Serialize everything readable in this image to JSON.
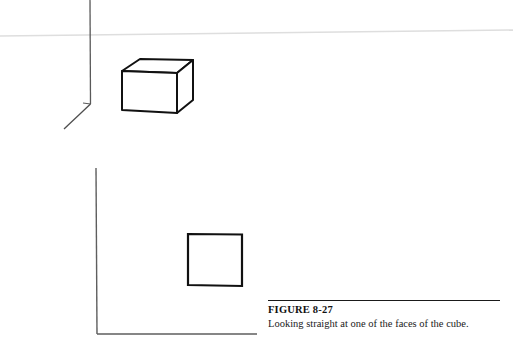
{
  "page": {
    "width": 513,
    "height": 352,
    "background": "#ffffff",
    "ink_color": "#111111",
    "axis_color": "#555555",
    "artifact_color": "#dedede"
  },
  "caption": {
    "label": "FIGURE 8-27",
    "text": "Looking straight at one of the faces of the cube."
  },
  "figures": [
    {
      "id": "perspective-view",
      "name": "three-axis-perspective-cube",
      "axes": {
        "origin": [
          90,
          104
        ],
        "vertical_axis": {
          "from": [
            90,
            0
          ],
          "to": [
            90,
            104
          ]
        },
        "horizontal_axis": {
          "from": [
            83,
            103
          ],
          "to": [
            90,
            104
          ]
        },
        "depth_axis": {
          "from": [
            90,
            104
          ],
          "to": [
            64,
            129
          ]
        }
      },
      "cube": {
        "type": "cube-perspective",
        "front_face": [
          [
            122,
            71
          ],
          [
            177,
            73
          ],
          [
            177,
            113
          ],
          [
            122,
            110
          ]
        ],
        "top_face": [
          [
            122,
            71
          ],
          [
            140,
            59
          ],
          [
            193,
            60
          ],
          [
            177,
            73
          ]
        ],
        "right_face": [
          [
            177,
            73
          ],
          [
            193,
            60
          ],
          [
            193,
            100
          ],
          [
            177,
            113
          ]
        ]
      }
    },
    {
      "id": "front-view",
      "name": "two-axis-square-face",
      "axes": {
        "origin": [
          97,
          334
        ],
        "vertical_axis": {
          "from": [
            96,
            168
          ],
          "to": [
            97,
            334
          ]
        },
        "horizontal_axis": {
          "from": [
            97,
            334
          ],
          "to": [
            257,
            334
          ]
        }
      },
      "square": {
        "type": "square",
        "corners": [
          [
            188,
            234
          ],
          [
            242,
            234
          ],
          [
            242,
            286
          ],
          [
            188,
            286
          ]
        ]
      }
    }
  ],
  "artifacts": {
    "scan_line": {
      "from": [
        0,
        36
      ],
      "to": [
        513,
        30
      ]
    }
  }
}
